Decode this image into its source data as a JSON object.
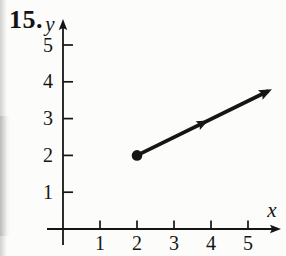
{
  "problem_number": "15.",
  "chart_data": {
    "type": "line",
    "subtype": "ray-on-coordinate-plane",
    "title": "",
    "xlabel": "x",
    "ylabel": "y",
    "xlim": [
      0,
      5.9
    ],
    "ylim": [
      0,
      5.6
    ],
    "x_ticks": [
      1,
      2,
      3,
      4,
      5
    ],
    "y_ticks": [
      1,
      2,
      3,
      4,
      5
    ],
    "grid": false,
    "legend": false,
    "series": [
      {
        "name": "ray",
        "description": "Ray with a closed (solid-dot) endpoint at (2, 2), slope 1/2, extending up-right through (4, 3); direction arrowhead drawn mid-ray and arrowhead at the drawn end near (5.5, 3.75)",
        "endpoint": [
          2,
          2
        ],
        "endpoint_style": "solid-dot",
        "points": [
          [
            2,
            2
          ],
          [
            5.55,
            3.75
          ]
        ],
        "slope": 0.5,
        "arrow_end": true,
        "mid_arrow": true
      }
    ]
  },
  "colors": {
    "ink": "#151515",
    "background": "#fcfcfa"
  }
}
